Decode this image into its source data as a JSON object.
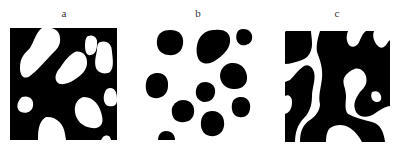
{
  "panels": [
    {
      "label": "a",
      "description": "white particles on black background",
      "foreground": "#ffffff",
      "background": "#000000"
    },
    {
      "label": "b",
      "description": "black particles on white background",
      "foreground": "#000000",
      "background": "#ffffff"
    },
    {
      "label": "c",
      "description": "bicontinuous black/white morphology",
      "foreground": "#000000",
      "background": "#ffffff"
    }
  ]
}
